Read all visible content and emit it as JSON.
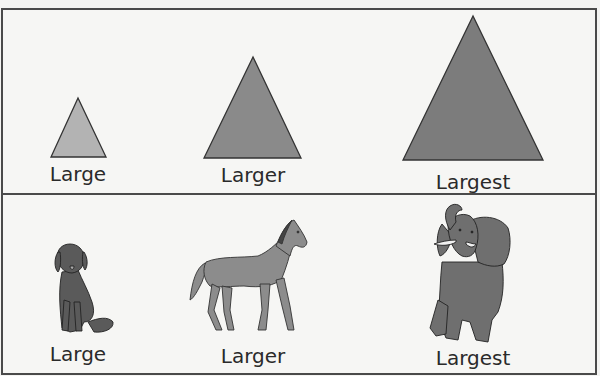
{
  "colors": {
    "border": "#4a4a4a",
    "background": "#f6f6f4",
    "triangle_small_fill": "#b3b3b3",
    "triangle_medium_fill": "#8a8a8a",
    "triangle_large_fill": "#7c7c7c",
    "animal_fill": "#7d7d7d",
    "outline": "#333333",
    "label_text": "#2a2a2a"
  },
  "shapes_row": {
    "items": [
      {
        "shape": "triangle",
        "size": "small",
        "label": "Large"
      },
      {
        "shape": "triangle",
        "size": "medium",
        "label": "Larger"
      },
      {
        "shape": "triangle",
        "size": "big",
        "label": "Largest"
      }
    ]
  },
  "animals_row": {
    "items": [
      {
        "animal": "dog",
        "label": "Large"
      },
      {
        "animal": "horse",
        "label": "Larger"
      },
      {
        "animal": "elephant",
        "label": "Largest"
      }
    ]
  }
}
